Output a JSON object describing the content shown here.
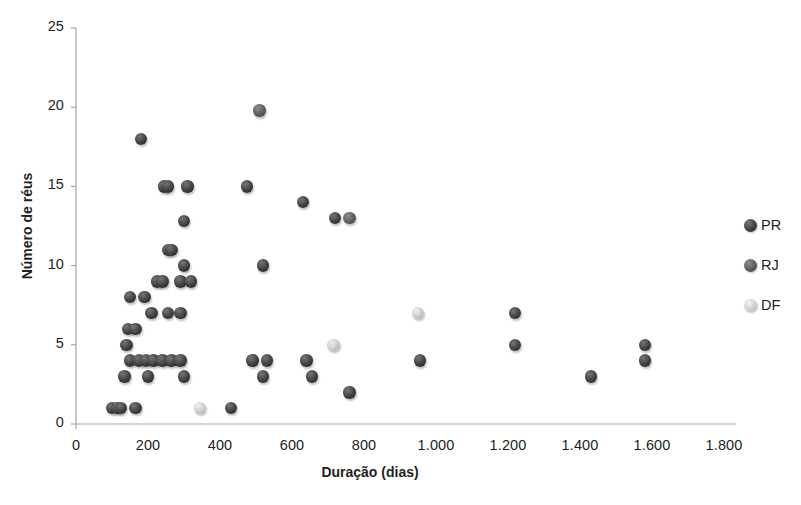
{
  "chart_data": {
    "type": "scatter",
    "title": "",
    "xlabel": "Duração (dias)",
    "ylabel": "Número de réus",
    "xlim": [
      0,
      1800
    ],
    "ylim": [
      0,
      25
    ],
    "xticks": [
      "0",
      "200",
      "400",
      "600",
      "800",
      "1.000",
      "1.200",
      "1.400",
      "1.600",
      "1.800"
    ],
    "xtick_values": [
      0,
      200,
      400,
      600,
      800,
      1000,
      1200,
      1400,
      1600,
      1800
    ],
    "yticks": [
      "0",
      "5",
      "10",
      "15",
      "20",
      "25"
    ],
    "ytick_values": [
      0,
      5,
      10,
      15,
      20,
      25
    ],
    "grid": false,
    "legend_position": "right",
    "series": [
      {
        "name": "PR",
        "color": "#3f3f3f",
        "points": [
          [
            180,
            18
          ],
          [
            245,
            15
          ],
          [
            255,
            15
          ],
          [
            310,
            15
          ],
          [
            475,
            15
          ],
          [
            630,
            14
          ],
          [
            720,
            13
          ],
          [
            300,
            12.8
          ],
          [
            255,
            11
          ],
          [
            265,
            11
          ],
          [
            300,
            10
          ],
          [
            520,
            10
          ],
          [
            225,
            9
          ],
          [
            240,
            9
          ],
          [
            290,
            9
          ],
          [
            320,
            9
          ],
          [
            150,
            8
          ],
          [
            190,
            8
          ],
          [
            210,
            7
          ],
          [
            255,
            7
          ],
          [
            290,
            7
          ],
          [
            1220,
            7
          ],
          [
            145,
            6
          ],
          [
            165,
            6
          ],
          [
            140,
            5
          ],
          [
            1220,
            5
          ],
          [
            1580,
            5
          ],
          [
            150,
            4
          ],
          [
            175,
            4
          ],
          [
            195,
            4
          ],
          [
            215,
            4
          ],
          [
            240,
            4
          ],
          [
            265,
            4
          ],
          [
            290,
            4
          ],
          [
            490,
            4
          ],
          [
            530,
            4
          ],
          [
            640,
            4
          ],
          [
            955,
            4
          ],
          [
            1580,
            4
          ],
          [
            135,
            3
          ],
          [
            200,
            3
          ],
          [
            300,
            3
          ],
          [
            520,
            3
          ],
          [
            655,
            3
          ],
          [
            1430,
            3
          ],
          [
            760,
            2
          ],
          [
            100,
            1
          ],
          [
            115,
            1
          ],
          [
            125,
            1
          ],
          [
            165,
            1
          ],
          [
            430,
            1
          ]
        ]
      },
      {
        "name": "RJ",
        "color": "#5c5c5c",
        "points": [
          [
            510,
            19.8
          ],
          [
            760,
            13
          ]
        ]
      },
      {
        "name": "DF",
        "color": "#c9c9c9",
        "points": [
          [
            950,
            7
          ],
          [
            715,
            5
          ],
          [
            345,
            1
          ]
        ]
      }
    ]
  },
  "legend": {
    "items": [
      {
        "label": "PR",
        "color": "#3f3f3f"
      },
      {
        "label": "RJ",
        "color": "#5c5c5c"
      },
      {
        "label": "DF",
        "color": "#cfcfcf"
      }
    ]
  },
  "axes": {
    "x_title": "Duração (dias)",
    "y_title": "Número de réus"
  },
  "caption": {
    "text": ""
  }
}
